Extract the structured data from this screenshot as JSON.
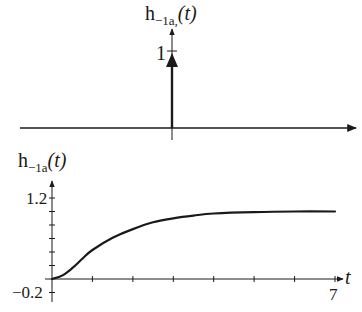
{
  "chart_data": [
    {
      "type": "line",
      "title": "h_{-1a,}(t)",
      "title_main": "h",
      "title_sub": "−1a,",
      "title_arg": "(t)",
      "description": "Unit impulse at t = 0 with height 1",
      "impulse": {
        "t": 0,
        "height": 1
      },
      "yticks": [
        "1"
      ],
      "xlabel": "",
      "ylabel": "h_{-1a,}(t)",
      "grid": false
    },
    {
      "type": "line",
      "title": "h_{-1a}(t)",
      "title_main": "h",
      "title_sub": "−1a",
      "title_arg": "(t)",
      "xlabel": "t",
      "ylabel": "h_{-1a}(t)",
      "xlim": [
        0,
        7
      ],
      "ylim": [
        -0.2,
        1.2
      ],
      "ytick_labels": [
        "1.2",
        "−0.2"
      ],
      "xtick_labels": [
        "7"
      ],
      "x_tick_step": 1,
      "y_tick_step": 0.2,
      "grid": false,
      "series": [
        {
          "name": "h_{-1a}(t)",
          "x": [
            0,
            0.25,
            0.5,
            0.75,
            1,
            1.5,
            2,
            2.5,
            3,
            3.5,
            4,
            5,
            6,
            7
          ],
          "values": [
            0,
            0.05,
            0.16,
            0.3,
            0.43,
            0.61,
            0.74,
            0.84,
            0.9,
            0.94,
            0.97,
            0.99,
            1.0,
            1.0
          ]
        }
      ]
    }
  ]
}
